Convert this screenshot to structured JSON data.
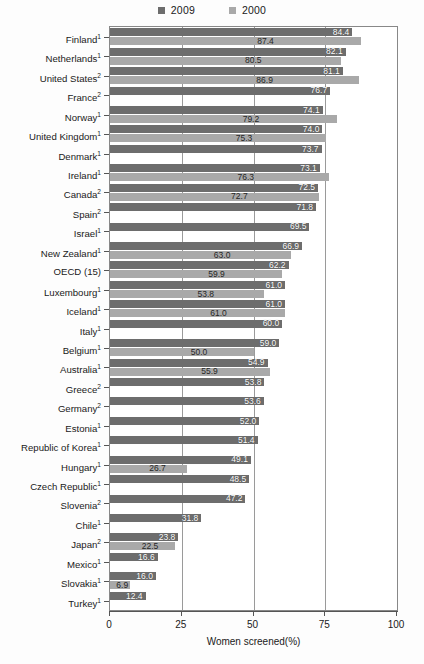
{
  "legend": {
    "position": "top-center",
    "entries": [
      {
        "label": "2009",
        "color": "#6d6d6d"
      },
      {
        "label": "2000",
        "color": "#a9a9a9"
      }
    ]
  },
  "axis": {
    "xlabel": "Women screened(%)",
    "ticks": [
      "0",
      "25",
      "50",
      "75",
      "100"
    ]
  },
  "chart_data": {
    "type": "bar",
    "orientation": "horizontal",
    "title": "",
    "subtitle": "",
    "xlabel": "Women screened(%)",
    "ylabel": "",
    "xlim": [
      0,
      100
    ],
    "xticks": [
      0,
      25,
      50,
      75,
      100
    ],
    "grid": true,
    "legend_position": "top-center",
    "categories": [
      "Finland",
      "Netherlands",
      "United States",
      "France",
      "Norway",
      "United Kingdom",
      "Denmark",
      "Ireland",
      "Canada",
      "Spain",
      "Israel",
      "New Zealand",
      "OECD (15)",
      "Luxembourg",
      "Iceland",
      "Italy",
      "Belgium",
      "Australia",
      "Greece",
      "Germany",
      "Estonia",
      "Republic of Korea",
      "Hungary",
      "Czech Republic",
      "Slovenia",
      "Chile",
      "Japan",
      "Mexico",
      "Slovakia",
      "Turkey"
    ],
    "category_footnotes": [
      "1",
      "1",
      "2",
      "2",
      "1",
      "1",
      "1",
      "1",
      "2",
      "2",
      "1",
      "1",
      "",
      "1",
      "1",
      "1",
      "1",
      "1",
      "2",
      "2",
      "1",
      "1",
      "1",
      "1",
      "2",
      "1",
      "2",
      "1",
      "1",
      "1"
    ],
    "series": [
      {
        "name": "2009",
        "color": "#6d6d6d",
        "values": [
          84.4,
          82.1,
          81.1,
          76.7,
          74.1,
          74.0,
          73.7,
          73.1,
          72.5,
          71.8,
          69.5,
          66.9,
          62.2,
          61.0,
          61.0,
          60.0,
          59.0,
          54.9,
          53.8,
          53.6,
          52.0,
          51.4,
          49.1,
          48.5,
          47.2,
          31.8,
          23.8,
          16.6,
          16.0,
          12.4
        ]
      },
      {
        "name": "2000",
        "color": "#a9a9a9",
        "values": [
          87.4,
          80.5,
          86.9,
          null,
          79.2,
          75.3,
          null,
          76.3,
          72.7,
          null,
          null,
          63.0,
          59.9,
          53.8,
          61.0,
          null,
          50.0,
          55.9,
          null,
          null,
          null,
          null,
          26.7,
          null,
          null,
          null,
          22.5,
          null,
          6.9,
          null
        ]
      }
    ]
  }
}
